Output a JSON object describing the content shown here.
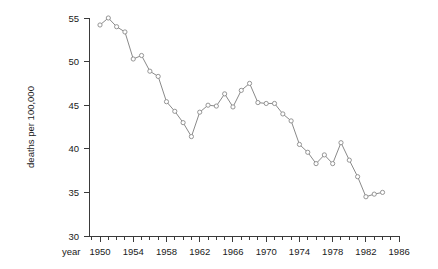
{
  "chart_data": {
    "type": "line",
    "title": "",
    "xlabel": "year",
    "ylabel": "deaths per 100,000",
    "xlim": [
      1948,
      1986
    ],
    "ylim": [
      30,
      55
    ],
    "x_major_ticks": [
      1950,
      1954,
      1958,
      1962,
      1966,
      1970,
      1974,
      1978,
      1982,
      1986
    ],
    "x_minor_tick_step": 1,
    "y_major_ticks": [
      30,
      35,
      40,
      45,
      50,
      55
    ],
    "grid": false,
    "legend": "none",
    "marker": "open-circle",
    "line_color": "#8a8a8a",
    "marker_color": "#8a8a8a",
    "axis_color": "#3a3a3a",
    "x": [
      1950,
      1951,
      1952,
      1953,
      1954,
      1955,
      1956,
      1957,
      1958,
      1959,
      1960,
      1961,
      1962,
      1963,
      1964,
      1965,
      1966,
      1967,
      1968,
      1969,
      1970,
      1971,
      1972,
      1973,
      1974,
      1975,
      1976,
      1977,
      1978,
      1979,
      1980,
      1981,
      1982,
      1983,
      1984
    ],
    "values": [
      54.2,
      55.0,
      54.0,
      53.4,
      50.3,
      50.7,
      48.9,
      48.3,
      45.4,
      44.3,
      43.0,
      41.4,
      44.2,
      45.0,
      44.9,
      46.3,
      44.8,
      46.7,
      47.5,
      45.3,
      45.2,
      45.2,
      44.0,
      43.2,
      40.5,
      39.6,
      38.3,
      39.3,
      38.3,
      40.7,
      38.7,
      36.8,
      34.5,
      34.8,
      35.0
    ],
    "x_tick_labels": [
      "1950",
      "1954",
      "1958",
      "1962",
      "1966",
      "1970",
      "1974",
      "1978",
      "1982",
      "1986"
    ],
    "y_tick_labels": [
      "30",
      "35",
      "40",
      "45",
      "50",
      "55"
    ]
  }
}
